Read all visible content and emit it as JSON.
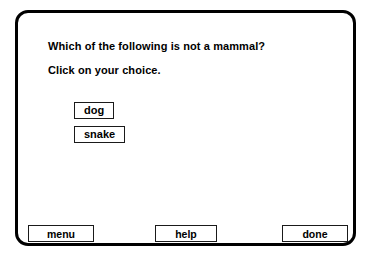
{
  "frame": {
    "border_color": "#000000",
    "background": "#ffffff"
  },
  "question": {
    "prompt": "Which of the following is not a mammal?",
    "instruction": "Click on your choice."
  },
  "choices": [
    {
      "label": "dog"
    },
    {
      "label": "snake"
    }
  ],
  "nav": {
    "menu_label": "menu",
    "help_label": "help",
    "done_label": "done"
  }
}
